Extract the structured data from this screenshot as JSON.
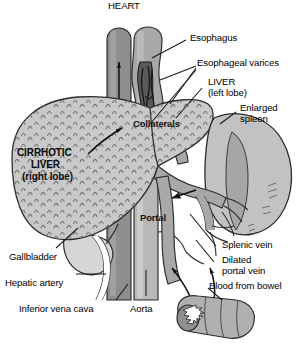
{
  "figure": {
    "background_color": "#ffffff",
    "width": 304,
    "height": 348
  },
  "palette": {
    "outline": "#2b2b2b",
    "liver_fill": "#c9c9c9",
    "liver_texture": "#6e6e6e",
    "spleen_fill": "#c2c2c2",
    "spleen_shade": "#a6a6a6",
    "vein_fill": "#a8a8a8",
    "vena_cava_fill": "#8e8e8e",
    "aorta_fill": "#b8b8b8",
    "gallbladder_fill": "#d6d6d6",
    "bowel_fill": "#b0b0b0",
    "varices_fill": "#555555",
    "label_text": "#000000",
    "leader_line": "#1a1a1a"
  },
  "labels": {
    "heart": "HEART",
    "esophagus": "Esophagus",
    "esophageal_varices": "Esophageal varices",
    "liver_left_lobe_line1": "LIVER",
    "liver_left_lobe_line2": "(left lobe)",
    "enlarged_spleen_line1": "Enlarged",
    "enlarged_spleen_line2": "spleen",
    "collaterals": "Collaterals",
    "cirrhotic_liver_line1": "CIRRHOTIC",
    "cirrhotic_liver_line2": "LIVER",
    "cirrhotic_liver_line3": "(right lobe)",
    "portal": "Portal",
    "splenic_vein": "Splenic vein",
    "dilated_portal_vein_line1": "Dilated",
    "dilated_portal_vein_line2": "portal vein",
    "blood_from_bowel": "Blood from bowel",
    "gallbladder": "Gallbladder",
    "hepatic_artery": "Hepatic artery",
    "inferior_vena_cava": "Inferior vena cava",
    "aorta": "Aorta"
  },
  "structures": [
    {
      "name": "heart",
      "label": "HEART"
    },
    {
      "name": "esophagus",
      "label": "Esophagus"
    },
    {
      "name": "esophageal-varices",
      "label": "Esophageal varices"
    },
    {
      "name": "liver-left-lobe",
      "label": "LIVER (left lobe)"
    },
    {
      "name": "enlarged-spleen",
      "label": "Enlarged spleen"
    },
    {
      "name": "collateral-vessels",
      "label": "Collaterals"
    },
    {
      "name": "cirrhotic-liver-right-lobe",
      "label": "CIRRHOTIC LIVER (right lobe)"
    },
    {
      "name": "portal-vein",
      "label": "Portal"
    },
    {
      "name": "splenic-vein",
      "label": "Splenic vein"
    },
    {
      "name": "dilated-portal-vein",
      "label": "Dilated portal vein"
    },
    {
      "name": "bowel-segment",
      "label": "Blood from bowel"
    },
    {
      "name": "gallbladder",
      "label": "Gallbladder"
    },
    {
      "name": "hepatic-artery",
      "label": "Hepatic artery"
    },
    {
      "name": "inferior-vena-cava",
      "label": "Inferior vena cava"
    },
    {
      "name": "aorta",
      "label": "Aorta"
    }
  ]
}
